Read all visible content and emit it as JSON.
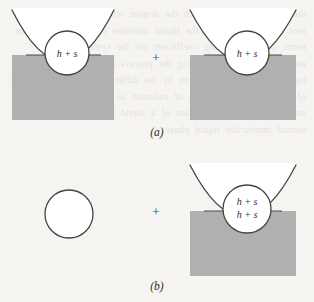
{
  "figure": {
    "background_color": "#f6f4f0",
    "ink_color": "#444444",
    "liquid_color": "#b0b0b0",
    "vessel_fill_color": "#ffffff",
    "circle_fill_color": "#ffffff",
    "panels": [
      {
        "id": "a",
        "caption": "(a)",
        "caption_x": 157,
        "caption_y": 136,
        "operator": "+",
        "operator_x": 156,
        "operator_y": 62,
        "items": [
          {
            "kind": "filled-vessel",
            "name": "vessel-left-a",
            "vessel": {
              "apex_x": 63,
              "apex_y": 112,
              "top_y": 10,
              "half_width_at_top": 51
            },
            "liquid_level_y": 55,
            "bubble": {
              "cx": 67,
              "cy": 53,
              "r": 22,
              "labels": [
                "h + s"
              ]
            }
          },
          {
            "kind": "filled-vessel",
            "name": "vessel-right-a",
            "vessel": {
              "apex_x": 243,
              "apex_y": 112,
              "top_y": 10,
              "half_width_at_top": 53
            },
            "liquid_level_y": 55,
            "bubble": {
              "cx": 247,
              "cy": 53,
              "r": 22,
              "labels": [
                "h + s"
              ]
            }
          }
        ]
      },
      {
        "id": "b",
        "caption": "(b)",
        "caption_x": 157,
        "caption_y": 290,
        "operator": "+",
        "operator_x": 156,
        "operator_y": 216,
        "items": [
          {
            "kind": "free-bubble",
            "name": "free-circle-b",
            "bubble": {
              "cx": 69,
              "cy": 214,
              "r": 24,
              "labels": []
            }
          },
          {
            "kind": "filled-vessel",
            "name": "vessel-right-b",
            "vessel": {
              "apex_x": 243,
              "apex_y": 268,
              "top_y": 165,
              "half_width_at_top": 53
            },
            "liquid_level_y": 211,
            "bubble": {
              "cx": 247,
              "cy": 209,
              "r": 24,
              "labels": [
                "h + s",
                "h + s"
              ]
            }
          }
        ]
      }
    ]
  },
  "ghost_text": "the conditions under which the droplet will spread or remain a lens on the surface of the liquid substrate can be expressed in terms of the spreading coefficient for the system the free energy change accompanying the process of spreading of one liquid over another is given by the difference between the work of adhesion and the work of cohesion as indicated by harkins and co workers for the case of a liquid lens resting upon a second immiscible liquid phase"
}
